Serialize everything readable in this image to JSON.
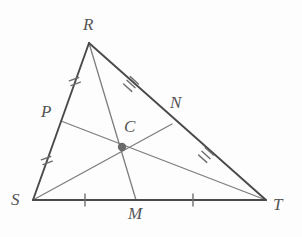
{
  "figure": {
    "background_color": "#fdfdfd",
    "triangle_stroke": "#4a4a4a",
    "cevian_stroke": "#7d7d7d",
    "tick_stroke": "#6e6e6e",
    "centroid_fill": "#6b6b6b",
    "label_color": "#555555",
    "vertices": [
      {
        "name": "R",
        "label": "R",
        "x": 89,
        "y": 43,
        "label_x": 83,
        "label_y": 16
      },
      {
        "name": "S",
        "label": "S",
        "x": 33,
        "y": 200,
        "label_x": 11,
        "label_y": 191
      },
      {
        "name": "T",
        "label": "T",
        "x": 266,
        "y": 200,
        "label_x": 273,
        "label_y": 196
      }
    ],
    "midpoints": [
      {
        "name": "P",
        "label": "P",
        "side": "SR",
        "x": 61,
        "y": 121,
        "label_x": 41,
        "label_y": 103,
        "ticks": 2
      },
      {
        "name": "N",
        "label": "N",
        "side": "RT",
        "x": 172,
        "y": 124,
        "label_x": 170,
        "label_y": 94,
        "ticks": 3
      },
      {
        "name": "M",
        "label": "M",
        "side": "ST",
        "x": 136,
        "y": 200,
        "label_x": 128,
        "label_y": 205,
        "ticks": 1
      }
    ],
    "centroid": {
      "name": "C",
      "label": "C",
      "x": 122,
      "y": 147,
      "label_x": 124,
      "label_y": 118,
      "radius": 4
    },
    "sides": [
      {
        "name": "RS",
        "from": "R",
        "to": "S"
      },
      {
        "name": "RT",
        "from": "R",
        "to": "T"
      },
      {
        "name": "ST",
        "from": "S",
        "to": "T"
      }
    ],
    "medians": [
      {
        "name": "median-RM",
        "from": "R",
        "to": "M"
      },
      {
        "name": "median-SN",
        "from": "S",
        "to": "N"
      },
      {
        "name": "median-PT",
        "from": "P",
        "to": "T"
      }
    ],
    "tick_marks": [
      {
        "name": "tick-SP",
        "segment": "SP",
        "count": 2,
        "x": 47,
        "y": 161
      },
      {
        "name": "tick-PR",
        "segment": "PR",
        "count": 2,
        "x": 75,
        "y": 82
      },
      {
        "name": "tick-RN",
        "segment": "RN",
        "count": 3,
        "x": 131,
        "y": 84
      },
      {
        "name": "tick-NT",
        "segment": "NT",
        "count": 3,
        "x": 206,
        "y": 155
      },
      {
        "name": "tick-SM",
        "segment": "SM",
        "count": 1,
        "x": 85,
        "y": 200
      },
      {
        "name": "tick-MT",
        "segment": "MT",
        "count": 1,
        "x": 193,
        "y": 200
      }
    ]
  }
}
